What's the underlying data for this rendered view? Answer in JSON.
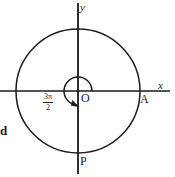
{
  "figure": {
    "background_color": "#ffffff",
    "stroke_color": "#1a1a1a",
    "axes": {
      "x_label": "x",
      "y_label": "y",
      "origin_label": "O"
    },
    "points": [
      {
        "name": "A",
        "label": "A",
        "description": "intersection of circle with positive x-axis"
      },
      {
        "name": "P",
        "label": "P",
        "description": "intersection of circle with negative y-axis"
      }
    ],
    "angle_arc": {
      "numerator": "3π",
      "denominator": "2",
      "sweep_degrees": 270,
      "direction": "counterclockwise"
    },
    "margin_text": {
      "left_fragment": "d"
    },
    "geometry": {
      "center_x": 78,
      "center_y": 91,
      "outer_radius": 62,
      "inner_radius": 14
    }
  }
}
